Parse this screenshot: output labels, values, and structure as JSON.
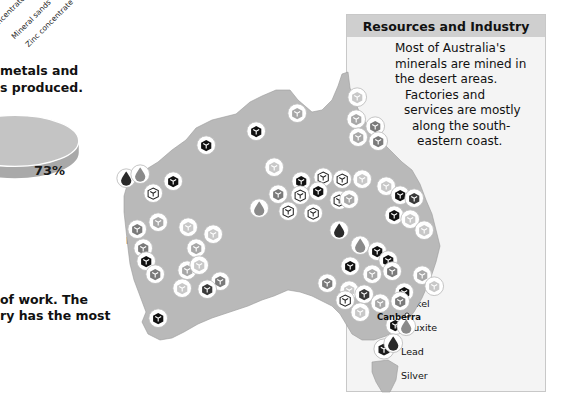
{
  "chart_header_labels": [
    "Coal",
    "Concentrate",
    "Mineral sands",
    "Zinc concentrate"
  ],
  "left_text": {
    "line1": "metals and",
    "line2": "s produced.",
    "line3": "of work. The",
    "line4": "ry has the most"
  },
  "chart_data": {
    "type": "pie",
    "slices": [
      {
        "label": "Manufacturing industry",
        "value": 73,
        "display": "73%"
      }
    ],
    "title": "",
    "legend": "right"
  },
  "panel": {
    "title": "Resources and Industry",
    "description": [
      "Most of Australia's",
      "minerals are mined in",
      "the desert areas.",
      "Factories and",
      "services are mostly",
      "along the south-",
      "eastern coast."
    ],
    "legend": [
      {
        "name": "Oil",
        "icon": "drop-icon",
        "color": "#2a2a2a"
      },
      {
        "name": "Coal",
        "icon": "cube-icon",
        "color": "#111111"
      },
      {
        "name": "Gas",
        "icon": "drop-icon",
        "color": "#8a8a8a"
      },
      {
        "name": "Iron",
        "icon": "cube-icon",
        "color": "#3a3a3a"
      },
      {
        "name": "Gold",
        "icon": "cube-icon",
        "color": "#c8c8c8"
      },
      {
        "name": "Nickel",
        "icon": "cube-icon",
        "color": "#7a7a7a"
      },
      {
        "name": "Bauxite",
        "icon": "cube-icon",
        "color": "#a8a8a8"
      },
      {
        "name": "Lead",
        "icon": "cube-icon",
        "color": "#1c1c1c"
      },
      {
        "name": "Silver",
        "icon": "cube-outline-icon",
        "color": "#ffffff"
      }
    ]
  },
  "map": {
    "city_label": "Canberra",
    "land_color": "#b9b9b9"
  }
}
